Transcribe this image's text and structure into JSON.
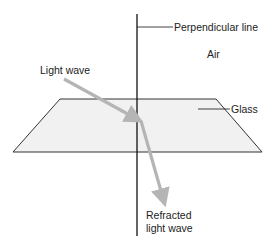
{
  "diagram": {
    "labels": {
      "perpendicular_line": "Perpendicular line",
      "air": "Air",
      "light_wave": "Light wave",
      "glass": "Glass",
      "refracted_line1": "Refracted",
      "refracted_line2": "light wave"
    },
    "colors": {
      "line": "#111111",
      "arrow": "#b5b5b5",
      "glass_fill": "#f1f1f1",
      "glass_edge": "#333333"
    }
  }
}
